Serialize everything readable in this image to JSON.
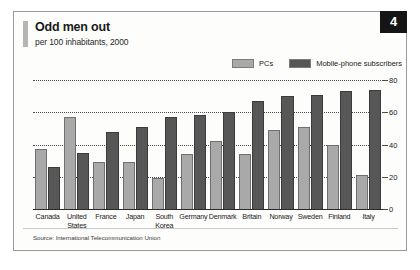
{
  "badge": {
    "number": "4"
  },
  "title": "Odd men out",
  "subtitle": "per 100 inhabitants, 2000",
  "source": "Source: International Telecommunication Union",
  "legend": [
    {
      "label": "PCs",
      "color": "#a9a9a9"
    },
    {
      "label": "Mobile-phone subscribers",
      "color": "#575757"
    }
  ],
  "chart_data": {
    "type": "bar",
    "title": "Odd men out",
    "subtitle": "per 100 inhabitants, 2000",
    "xlabel": "",
    "ylabel": "per 100 inhabitants",
    "ylim": [
      0,
      80
    ],
    "yticks": [
      0,
      20,
      40,
      60,
      80
    ],
    "grid": true,
    "legend_position": "top-right",
    "axis_side": "right",
    "categories": [
      "Canada",
      "United States",
      "France",
      "Japan",
      "South Korea",
      "Germany",
      "Denmark",
      "Britain",
      "Norway",
      "Sweden",
      "Finland",
      "Italy"
    ],
    "series": [
      {
        "name": "PCs",
        "color": "#a9a9a9",
        "values": [
          37,
          57,
          29,
          29,
          19,
          34,
          42,
          34,
          49,
          51,
          40,
          21
        ]
      },
      {
        "name": "Mobile-phone subscribers",
        "color": "#575757",
        "values": [
          26,
          35,
          48,
          51,
          57,
          58,
          60,
          67,
          70,
          71,
          73,
          74
        ]
      }
    ]
  }
}
